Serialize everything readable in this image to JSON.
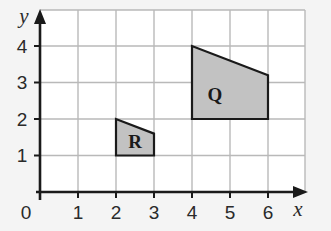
{
  "diagram": {
    "type": "coordinate-grid",
    "axes": {
      "x_label": "x",
      "y_label": "y",
      "origin_label": "0",
      "x_ticks": [
        "1",
        "2",
        "3",
        "4",
        "5",
        "6"
      ],
      "y_ticks": [
        "1",
        "2",
        "3",
        "4"
      ],
      "x_range": [
        0,
        7
      ],
      "y_range": [
        0,
        5
      ]
    },
    "shapes": [
      {
        "label": "R",
        "vertices": [
          [
            2,
            1
          ],
          [
            2,
            2
          ],
          [
            3,
            1.6
          ],
          [
            3,
            1
          ]
        ],
        "fill": "#c2c2c2"
      },
      {
        "label": "Q",
        "vertices": [
          [
            4,
            2
          ],
          [
            4,
            4
          ],
          [
            6,
            3.2
          ],
          [
            6,
            2
          ]
        ],
        "fill": "#c2c2c2"
      }
    ],
    "colors": {
      "grid": "#b9b9b9",
      "axis": "#1a1a1a",
      "background": "#ffffff"
    }
  }
}
